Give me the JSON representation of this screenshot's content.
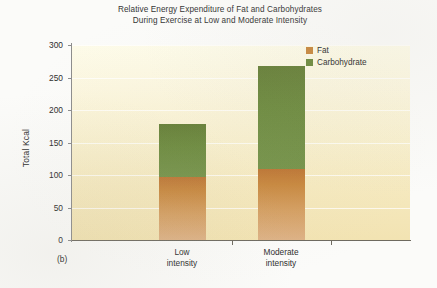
{
  "figure": {
    "label": "(b)"
  },
  "chart_data": {
    "type": "bar",
    "subtype": "stacked",
    "title": "Relative Energy Expenditure of Fat and Carbohydrates During Exercise at Low and Moderate Intensity",
    "title_lines": [
      "Relative Energy Expenditure of Fat and Carbohydrates",
      "During Exercise at Low and Moderate Intensity"
    ],
    "xlabel": "",
    "ylabel": "Total Kcal",
    "ylim": [
      0,
      300
    ],
    "ytick_step": 50,
    "yticks": [
      0,
      50,
      100,
      150,
      200,
      250,
      300
    ],
    "ytick_labels": [
      "0",
      "50",
      "100",
      "150",
      "200",
      "250",
      "300"
    ],
    "grid": true,
    "grid_axis": "y",
    "categories": [
      "Low intensity",
      "Moderate intensity"
    ],
    "category_lines": [
      [
        "Low",
        "intensity"
      ],
      [
        "Moderate",
        "intensity"
      ]
    ],
    "legend_position": "top-right",
    "series": [
      {
        "name": "Fat",
        "color": "#c8883f",
        "values": [
          97,
          109
        ]
      },
      {
        "name": "Carbohydrate",
        "color": "#6c8a3e",
        "values": [
          81,
          159
        ]
      }
    ],
    "totals": [
      178,
      268
    ],
    "plot_background": "#f8f0cf"
  },
  "legend": {
    "items": [
      {
        "label": "Fat",
        "color": "#c8883f"
      },
      {
        "label": "Carbohydrate",
        "color": "#6c8a3e"
      }
    ]
  }
}
